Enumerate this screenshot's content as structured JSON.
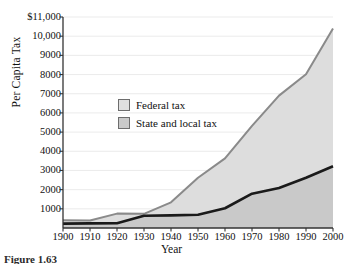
{
  "chart_data": {
    "type": "area",
    "title": "",
    "xlabel": "Year",
    "ylabel": "Per Capita Tax",
    "xlim": [
      1900,
      2000
    ],
    "ylim": [
      0,
      11000
    ],
    "grid": true,
    "legend_position": "inside-upper-left",
    "x": [
      1900,
      1910,
      1920,
      1930,
      1940,
      1950,
      1960,
      1970,
      1980,
      1990,
      2000
    ],
    "xtick_labels": [
      "1900",
      "1910",
      "1920",
      "1930",
      "1940",
      "1950",
      "1960",
      "1970",
      "1980",
      "1990",
      "2000"
    ],
    "ytick_values": [
      1000,
      2000,
      3000,
      4000,
      5000,
      6000,
      7000,
      8000,
      9000,
      10000,
      11000
    ],
    "ytick_labels": [
      "1000",
      "2000",
      "3000",
      "4000",
      "5000",
      "6000",
      "7000",
      "8000",
      "9000",
      "10,000",
      "$11,000"
    ],
    "stacked": true,
    "series": [
      {
        "name": "State and local tax",
        "color": "#1a1a1a",
        "fill": "#c9c9c9",
        "values": [
          230,
          240,
          250,
          640,
          660,
          690,
          1030,
          1790,
          2090,
          2620,
          3220
        ]
      },
      {
        "name": "Federal tax",
        "color": "#8a8a8a",
        "fill": "#dddddd",
        "values": [
          180,
          150,
          500,
          100,
          680,
          1930,
          2600,
          3530,
          4810,
          5400,
          7180
        ]
      }
    ],
    "totals": [
      410,
      390,
      750,
      740,
      1340,
      2620,
      3630,
      5320,
      6900,
      8020,
      10400
    ],
    "legend": [
      {
        "label": "Federal tax",
        "swatch": "#e0e0e0"
      },
      {
        "label": "State and local tax",
        "swatch": "#c9c9c9"
      }
    ]
  },
  "figure": {
    "caption": "Figure 1.63"
  }
}
